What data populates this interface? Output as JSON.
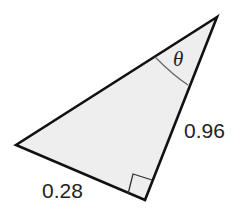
{
  "diagram": {
    "type": "right-triangle",
    "vertices": {
      "top": [
        217,
        17
      ],
      "left": [
        16,
        145
      ],
      "right_angle": [
        145,
        200
      ]
    },
    "fill_color": "#eeeeee",
    "stroke_color": "#111111",
    "arc_color": "#666666",
    "labels": {
      "angle": "θ",
      "side_right": "0.96",
      "side_bottom": "0.28"
    },
    "right_angle_marker": true
  }
}
